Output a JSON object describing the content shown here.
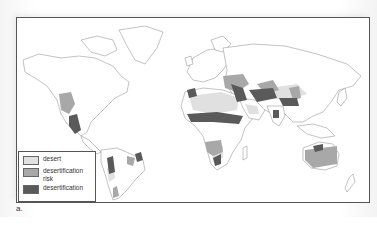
{
  "figure": {
    "caption": "a."
  },
  "legend": {
    "items": [
      {
        "label": "desert",
        "color": "#e0e0e0"
      },
      {
        "label": "desertification risk",
        "color": "#a8a8a8"
      },
      {
        "label": "desertification",
        "color": "#5a5a5a"
      }
    ]
  },
  "colors": {
    "land": "#ffffff",
    "coast": "#9a9a9a",
    "desert": "#e0e0e0",
    "risk": "#a8a8a8",
    "desertification": "#5a5a5a",
    "frame": "#555555"
  }
}
